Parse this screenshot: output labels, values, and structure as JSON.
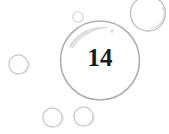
{
  "figure": {
    "canvas": {
      "width": 169,
      "height": 134,
      "background": "#ffffff"
    },
    "label": {
      "text": "14",
      "color": "#1a1a1a",
      "font_size_px": 25,
      "x": 100,
      "y": 57
    },
    "stroke_colors": {
      "main_outline": "#b3aeae",
      "small_outline": "#c9c6c6",
      "faint_outline": "#d8d6d6",
      "highlight": "#dcdada"
    },
    "bubbles": [
      {
        "name": "main-bubble",
        "cx": 100,
        "cy": 60.5,
        "r": 39.5,
        "stroke": "#b3aeae",
        "stroke_width": 1.6,
        "fill": "#ffffff"
      },
      {
        "name": "top-right-bubble",
        "cx": 148,
        "cy": 14,
        "r": 17.5,
        "stroke": "#c4c1c1",
        "stroke_width": 1.4,
        "fill": "#ffffff"
      },
      {
        "name": "top-right-inner-arc",
        "cx": 148,
        "cy": 14,
        "r": 14.5,
        "stroke": "#d9d7d7",
        "stroke_width": 1.1,
        "fill": "none"
      },
      {
        "name": "left-bubble",
        "cx": 18.5,
        "cy": 64.5,
        "r": 9.6,
        "stroke": "#cac7c7",
        "stroke_width": 1.2,
        "fill": "#ffffff"
      },
      {
        "name": "left-bubble-inner-arc",
        "cx": 18.5,
        "cy": 64.5,
        "r": 7.6,
        "stroke": "#ddbdbd",
        "stroke_width": 0.9,
        "fill": "none"
      },
      {
        "name": "bottom-left-bubble",
        "cx": 52.5,
        "cy": 117.5,
        "r": 9.6,
        "stroke": "#cac7c7",
        "stroke_width": 1.2,
        "fill": "#ffffff"
      },
      {
        "name": "bottom-right-bubble",
        "cx": 83.5,
        "cy": 116.5,
        "r": 9.6,
        "stroke": "#cac7c7",
        "stroke_width": 1.2,
        "fill": "#ffffff"
      },
      {
        "name": "tiny-top-bubble",
        "cx": 78,
        "cy": 17,
        "r": 5.2,
        "stroke": "#d2d0d0",
        "stroke_width": 1.1,
        "fill": "#ffffff"
      }
    ],
    "highlights": [
      {
        "name": "main-bubble-crescent-highlight",
        "path": "M 70 45 C 76 33, 90 26, 106 27 C 92 30, 79 36, 73 47 Z",
        "fill": "#e0dede"
      },
      {
        "name": "main-bubble-speck-highlight",
        "cx": 112,
        "cy": 31,
        "r": 1.6,
        "fill": "#dedcdc"
      }
    ]
  }
}
